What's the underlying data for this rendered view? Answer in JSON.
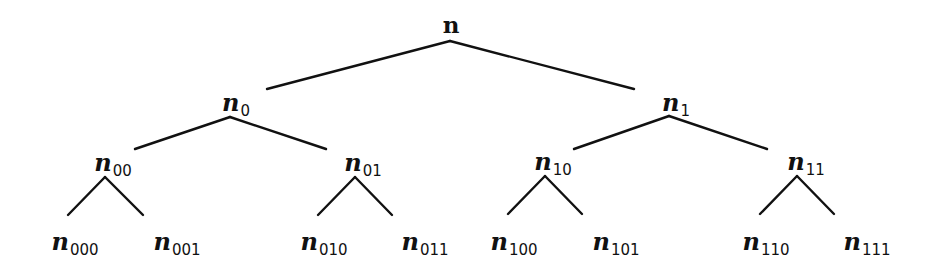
{
  "diagram": {
    "type": "binary-tree",
    "edge_color": "#111111",
    "nodes": {
      "root": {
        "base": "n",
        "sub": ""
      },
      "n0": {
        "base": "n",
        "sub": "0"
      },
      "n1": {
        "base": "n",
        "sub": "1"
      },
      "n00": {
        "base": "n",
        "sub": "00"
      },
      "n01": {
        "base": "n",
        "sub": "01"
      },
      "n10": {
        "base": "n",
        "sub": "10"
      },
      "n11": {
        "base": "n",
        "sub": "11"
      },
      "n000": {
        "base": "n",
        "sub": "000"
      },
      "n001": {
        "base": "n",
        "sub": "001"
      },
      "n010": {
        "base": "n",
        "sub": "010"
      },
      "n011": {
        "base": "n",
        "sub": "011"
      },
      "n100": {
        "base": "n",
        "sub": "100"
      },
      "n101": {
        "base": "n",
        "sub": "101"
      },
      "n110": {
        "base": "n",
        "sub": "110"
      },
      "n111": {
        "base": "n",
        "sub": "111"
      }
    },
    "edges": [
      [
        "n",
        "n0"
      ],
      [
        "n",
        "n1"
      ],
      [
        "n0",
        "n00"
      ],
      [
        "n0",
        "n01"
      ],
      [
        "n1",
        "n10"
      ],
      [
        "n1",
        "n11"
      ],
      [
        "n00",
        "n000"
      ],
      [
        "n00",
        "n001"
      ],
      [
        "n01",
        "n010"
      ],
      [
        "n01",
        "n011"
      ],
      [
        "n10",
        "n100"
      ],
      [
        "n10",
        "n101"
      ],
      [
        "n11",
        "n110"
      ],
      [
        "n11",
        "n111"
      ]
    ]
  }
}
